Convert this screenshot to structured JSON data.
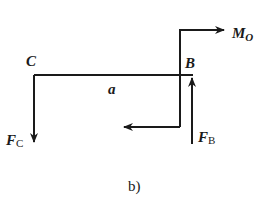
{
  "diagram": {
    "caption": "b)",
    "points": {
      "C": "C",
      "B": "B"
    },
    "dimension": "a",
    "forces": {
      "fc": {
        "main": "F",
        "sub": "C",
        "direction": "down"
      },
      "fb": {
        "main": "F",
        "sub": "B",
        "direction": "up"
      },
      "mo": {
        "main": "M",
        "sub": "O",
        "direction": "right"
      }
    },
    "colors": {
      "stroke": "#1a1a1a",
      "background": "#ffffff"
    }
  }
}
